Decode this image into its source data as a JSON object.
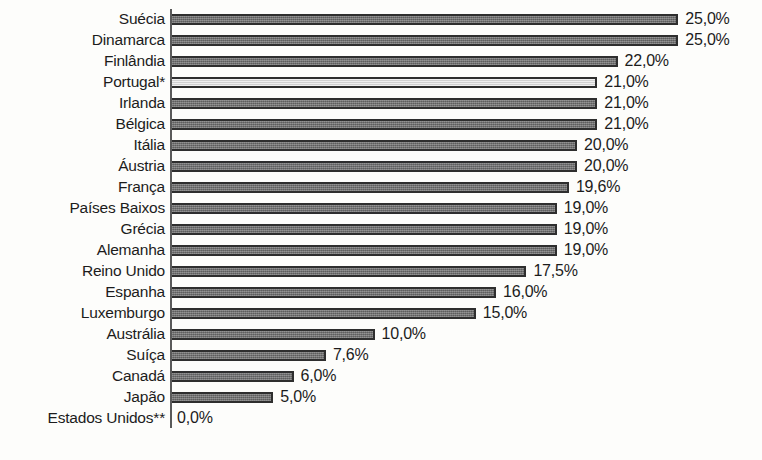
{
  "chart_data": {
    "type": "bar",
    "orientation": "horizontal",
    "title": "",
    "subtitle": "",
    "xlabel": "",
    "ylabel": "",
    "grid": false,
    "legend": "none",
    "value_suffix": "%",
    "decimal_separator": ",",
    "xlim": [
      0,
      25
    ],
    "axis_origin_label": "0,0%",
    "categories": [
      "Suécia",
      "Dinamarca",
      "Finlândia",
      "Portugal*",
      "Irlanda",
      "Bélgica",
      "Itália",
      "Áustria",
      "França",
      "Países Baixos",
      "Grécia",
      "Alemanha",
      "Reino Unido",
      "Espanha",
      "Luxemburgo",
      "Austrália",
      "Suíça",
      "Canadá",
      "Japão",
      "Estados Unidos**"
    ],
    "values": [
      25.0,
      25.0,
      22.0,
      21.0,
      21.0,
      21.0,
      20.0,
      20.0,
      19.6,
      19.0,
      19.0,
      19.0,
      17.5,
      16.0,
      15.0,
      10.0,
      7.6,
      6.0,
      5.0,
      0.0
    ],
    "data_labels": [
      "25,0%",
      "25,0%",
      "22,0%",
      "21,0%",
      "21,0%",
      "21,0%",
      "20,0%",
      "20,0%",
      "19,6%",
      "19,0%",
      "19,0%",
      "19,0%",
      "17,5%",
      "16,0%",
      "15,0%",
      "10,0%",
      "7,6%",
      "6,0%",
      "5,0%",
      "0,0%"
    ],
    "highlighted_category": "Portugal*",
    "colors": {
      "bar_fill": "#6f6f6f",
      "bar_highlight_fill": "#dcdcdc",
      "bar_border": "#2e2e2e",
      "axis_line": "#5a5a5a",
      "text": "#1c1c1c",
      "background": "#fdfdfb"
    }
  }
}
